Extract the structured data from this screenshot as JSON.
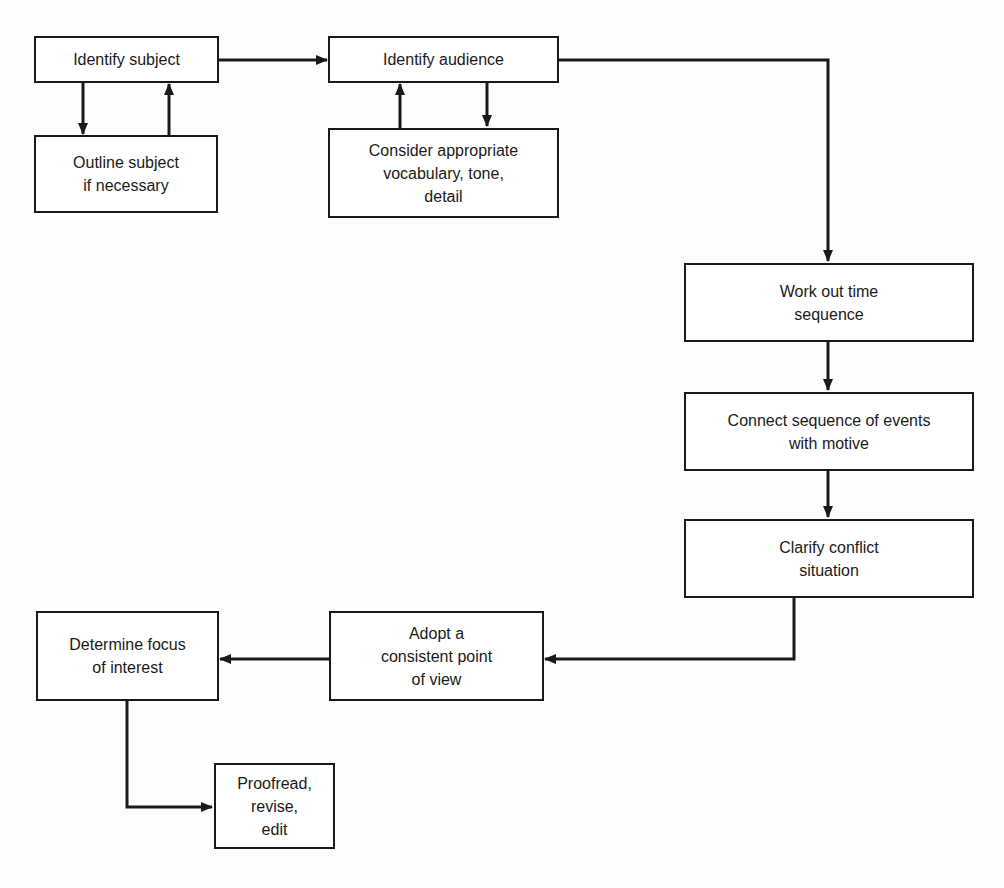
{
  "diagram": {
    "type": "flowchart",
    "colors": {
      "stroke": "#1a1a1a",
      "background": "#ffffff"
    },
    "nodes": [
      {
        "id": "identify_subject",
        "label": "Identify subject"
      },
      {
        "id": "outline_subject",
        "label": "Outline subject\nif necessary"
      },
      {
        "id": "identify_audience",
        "label": "Identify audience"
      },
      {
        "id": "consider_vocabulary",
        "label": "Consider appropriate\nvocabulary, tone,\ndetail"
      },
      {
        "id": "work_out_time",
        "label": "Work out time\nsequence"
      },
      {
        "id": "connect_sequence",
        "label": "Connect sequence of events\nwith motive"
      },
      {
        "id": "clarify_conflict",
        "label": "Clarify conflict\nsituation"
      },
      {
        "id": "adopt_point_of_view",
        "label": "Adopt a\nconsistent point\nof view"
      },
      {
        "id": "determine_focus",
        "label": "Determine focus\nof interest"
      },
      {
        "id": "proofread",
        "label": "Proofread,\nrevise,\nedit"
      }
    ],
    "edges": [
      {
        "from": "identify_subject",
        "to": "outline_subject"
      },
      {
        "from": "outline_subject",
        "to": "identify_subject"
      },
      {
        "from": "identify_subject",
        "to": "identify_audience"
      },
      {
        "from": "consider_vocabulary",
        "to": "identify_audience"
      },
      {
        "from": "identify_audience",
        "to": "consider_vocabulary"
      },
      {
        "from": "identify_audience",
        "to": "work_out_time"
      },
      {
        "from": "work_out_time",
        "to": "connect_sequence"
      },
      {
        "from": "connect_sequence",
        "to": "clarify_conflict"
      },
      {
        "from": "clarify_conflict",
        "to": "adopt_point_of_view"
      },
      {
        "from": "adopt_point_of_view",
        "to": "determine_focus"
      },
      {
        "from": "determine_focus",
        "to": "proofread"
      }
    ]
  }
}
